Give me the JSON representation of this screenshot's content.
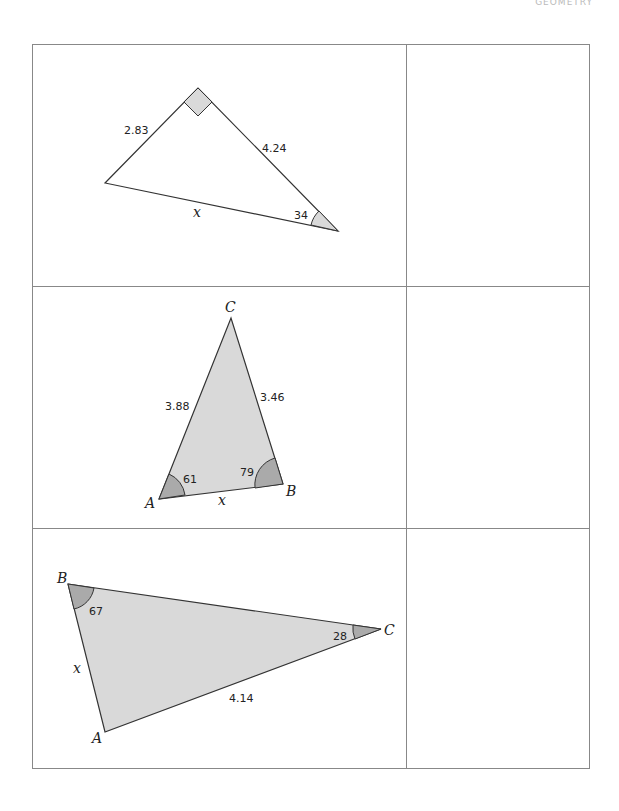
{
  "header": {
    "title": "GEOMETRY"
  },
  "problems": [
    {
      "sides": {
        "left": "2.83",
        "right": "4.24",
        "bottom": "x"
      },
      "angles": {
        "bottom_right": "34"
      },
      "right_angle": true
    },
    {
      "vertices": {
        "a": "A",
        "b": "B",
        "c": "C"
      },
      "sides": {
        "ac": "3.88",
        "bc": "3.46",
        "ab": "x"
      },
      "angles": {
        "a": "61",
        "b": "79"
      }
    },
    {
      "vertices": {
        "a": "A",
        "b": "B",
        "c": "C"
      },
      "sides": {
        "ab": "x",
        "ac": "4.14"
      },
      "angles": {
        "b": "67",
        "c": "28"
      }
    }
  ],
  "colors": {
    "fill": "#d9d9d9",
    "angle_fill": "#aaaaaa",
    "stroke": "#333333"
  }
}
